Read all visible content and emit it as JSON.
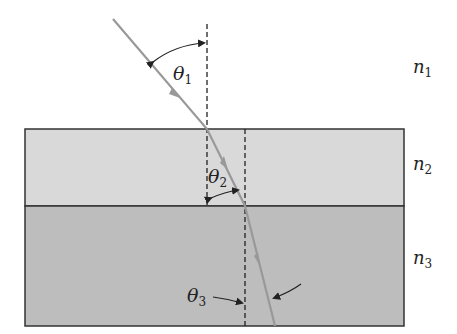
{
  "diagram": {
    "media": [
      {
        "id": "medium-1",
        "label": "n",
        "subscript": "1",
        "color": "#ffffff"
      },
      {
        "id": "medium-2",
        "label": "n",
        "subscript": "2",
        "color": "#d9d9d9"
      },
      {
        "id": "medium-3",
        "label": "n",
        "subscript": "3",
        "color": "#bdbdbd"
      }
    ],
    "angles": [
      {
        "id": "theta-1",
        "label": "θ",
        "subscript": "1"
      },
      {
        "id": "theta-2",
        "label": "θ",
        "subscript": "2"
      },
      {
        "id": "theta-3",
        "label": "θ",
        "subscript": "3"
      }
    ],
    "colors": {
      "ray": "#999999",
      "border": "#333333",
      "normal": "#222222"
    }
  }
}
